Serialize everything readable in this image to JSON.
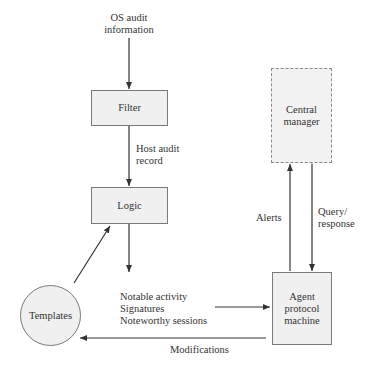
{
  "diagram": {
    "nodes": {
      "filter": {
        "label": "Filter"
      },
      "logic": {
        "label": "Logic"
      },
      "templates": {
        "label": "Templates"
      },
      "central_manager": {
        "label_line1": "Central",
        "label_line2": "manager"
      },
      "agent": {
        "label_line1": "Agent",
        "label_line2": "protocol",
        "label_line3": "machine"
      }
    },
    "edges": {
      "os_audit": {
        "line1": "OS audit",
        "line2": "information"
      },
      "host_audit": {
        "line1": "Host audit",
        "line2": "record"
      },
      "notable": {
        "line1": "Notable activity",
        "line2": "Signatures",
        "line3": "Noteworthy sessions"
      },
      "alerts": {
        "label": "Alerts"
      },
      "query": {
        "line1": "Query/",
        "line2": "response"
      },
      "modifications": {
        "label": "Modifications"
      }
    },
    "colors": {
      "box_fill": "#f0f0f0",
      "box_border": "#7a7a7a",
      "line": "#333333"
    }
  }
}
